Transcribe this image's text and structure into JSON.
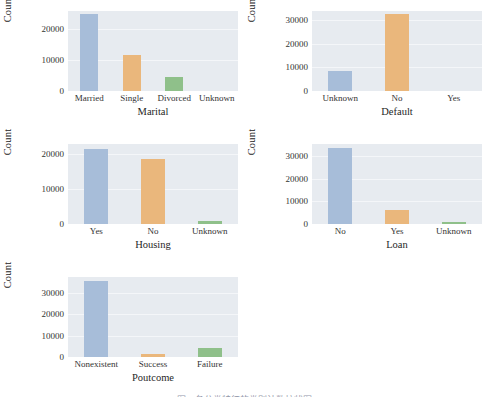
{
  "figure": {
    "background": "#ffffff",
    "grid_style": "seaborn-darkgrid",
    "panel_background": "#e7ebf0",
    "gridline_color": "#f4f6f9",
    "caption_text": "图 2 各分类特征的类别计数柱状图",
    "caption_clipped": true,
    "palette": {
      "blue": "#a7bdd9",
      "orange": "#eab77c",
      "green": "#8fc08a"
    }
  },
  "chart_data": [
    {
      "type": "bar",
      "title": "",
      "xlabel": "Marital",
      "ylabel": "Count",
      "categories": [
        "Married",
        "Single",
        "Divorced",
        "Unknown"
      ],
      "values": [
        24928,
        11568,
        4612,
        80
      ],
      "colors": [
        "#a7bdd9",
        "#eab77c",
        "#8fc08a",
        "#a7bdd9"
      ],
      "yticks": [
        0,
        10000,
        20000
      ],
      "ytick_labels": [
        "0",
        "10000",
        "20000"
      ],
      "ylim": [
        0,
        26000
      ],
      "grid": true,
      "legend": "none"
    },
    {
      "type": "bar",
      "title": "",
      "xlabel": "Default",
      "ylabel": "Count",
      "categories": [
        "Unknown",
        "No",
        "Yes"
      ],
      "values": [
        8597,
        32588,
        3
      ],
      "colors": [
        "#a7bdd9",
        "#eab77c",
        "#8fc08a"
      ],
      "yticks": [
        0,
        10000,
        20000,
        30000
      ],
      "ytick_labels": [
        "0",
        "10000",
        "20000",
        "30000"
      ],
      "ylim": [
        0,
        34000
      ],
      "grid": true,
      "legend": "none"
    },
    {
      "type": "bar",
      "title": "",
      "xlabel": "Housing",
      "ylabel": "Count",
      "categories": [
        "Yes",
        "No",
        "Unknown"
      ],
      "values": [
        21576,
        18622,
        990
      ],
      "colors": [
        "#a7bdd9",
        "#eab77c",
        "#8fc08a"
      ],
      "yticks": [
        0,
        10000,
        20000
      ],
      "ytick_labels": [
        "0",
        "10000",
        "20000"
      ],
      "ylim": [
        0,
        23000
      ],
      "grid": true,
      "legend": "none"
    },
    {
      "type": "bar",
      "title": "",
      "xlabel": "Loan",
      "ylabel": "Count",
      "categories": [
        "No",
        "Yes",
        "Unknown"
      ],
      "values": [
        33950,
        6248,
        990
      ],
      "colors": [
        "#a7bdd9",
        "#eab77c",
        "#8fc08a"
      ],
      "yticks": [
        0,
        10000,
        20000,
        30000
      ],
      "ytick_labels": [
        "0",
        "10000",
        "20000",
        "30000"
      ],
      "ylim": [
        0,
        35500
      ],
      "grid": true,
      "legend": "none"
    },
    {
      "type": "bar",
      "title": "",
      "xlabel": "Poutcome",
      "ylabel": "Count",
      "categories": [
        "Nonexistent",
        "Success",
        "Failure"
      ],
      "values": [
        35563,
        1373,
        4252
      ],
      "colors": [
        "#a7bdd9",
        "#eab77c",
        "#8fc08a"
      ],
      "yticks": [
        0,
        10000,
        20000,
        30000
      ],
      "ytick_labels": [
        "0",
        "10000",
        "20000",
        "30000"
      ],
      "ylim": [
        0,
        37500
      ],
      "grid": true,
      "legend": "none"
    }
  ]
}
